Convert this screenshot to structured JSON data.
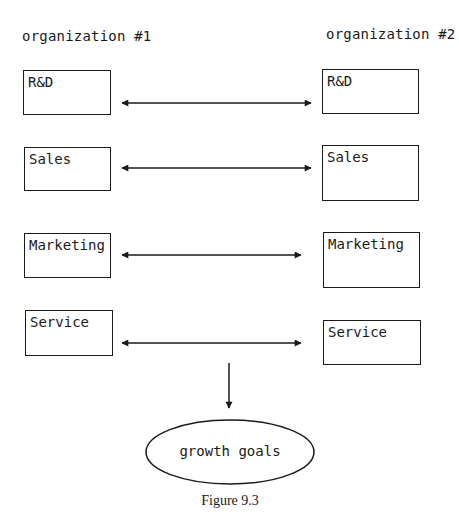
{
  "diagram": {
    "left_header": "organization #1",
    "right_header": "organization #2",
    "left_units": [
      {
        "label": "R&D"
      },
      {
        "label": "Sales"
      },
      {
        "label": "Marketing"
      },
      {
        "label": "Service"
      }
    ],
    "right_units": [
      {
        "label": "R&D"
      },
      {
        "label": "Sales"
      },
      {
        "label": "Marketing"
      },
      {
        "label": "Service"
      }
    ],
    "connectors": [
      {
        "from": "organization #1 R&D",
        "to": "organization #2 R&D",
        "type": "bidirectional-arrow"
      },
      {
        "from": "organization #1 Sales",
        "to": "organization #2 Sales",
        "type": "bidirectional-arrow"
      },
      {
        "from": "organization #1 Marketing",
        "to": "organization #2 Marketing",
        "type": "bidirectional-arrow"
      },
      {
        "from": "organization #1 Service",
        "to": "organization #2 Service",
        "type": "bidirectional-arrow"
      },
      {
        "from": "Service link",
        "to": "growth goals",
        "type": "down-arrow"
      }
    ],
    "goal": "growth goals",
    "caption": "Figure 9.3",
    "line_color": "#1a1a1a"
  }
}
